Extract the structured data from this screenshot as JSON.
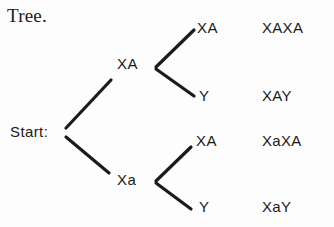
{
  "figure": {
    "caption": "Tree.",
    "background_color": "#fdfdfd",
    "ink_color": "#1b1b1b"
  },
  "tree": {
    "root": {
      "label": "Start:"
    },
    "branches": [
      {
        "node_label": "XA",
        "leaves": [
          {
            "leaf_label": "XA",
            "result": "XAXA"
          },
          {
            "leaf_label": "Y",
            "result": "XAY"
          }
        ]
      },
      {
        "node_label": "Xa",
        "leaves": [
          {
            "leaf_label": "XA",
            "result": "XaXA"
          },
          {
            "leaf_label": "Y",
            "result": "XaY"
          }
        ]
      }
    ]
  },
  "edges": {
    "root_to_upper": {
      "x1": 66,
      "y1": 128,
      "x2": 111,
      "y2": 80
    },
    "root_to_lower": {
      "x1": 66,
      "y1": 137,
      "x2": 109,
      "y2": 173
    },
    "upper_fork_top": {
      "x1": 156,
      "y1": 67,
      "x2": 194,
      "y2": 30
    },
    "upper_fork_bottom": {
      "x1": 156,
      "y1": 69,
      "x2": 194,
      "y2": 96
    },
    "lower_fork_top": {
      "x1": 156,
      "y1": 181,
      "x2": 191,
      "y2": 147
    },
    "lower_fork_bottom": {
      "x1": 156,
      "y1": 183,
      "x2": 191,
      "y2": 209
    }
  }
}
